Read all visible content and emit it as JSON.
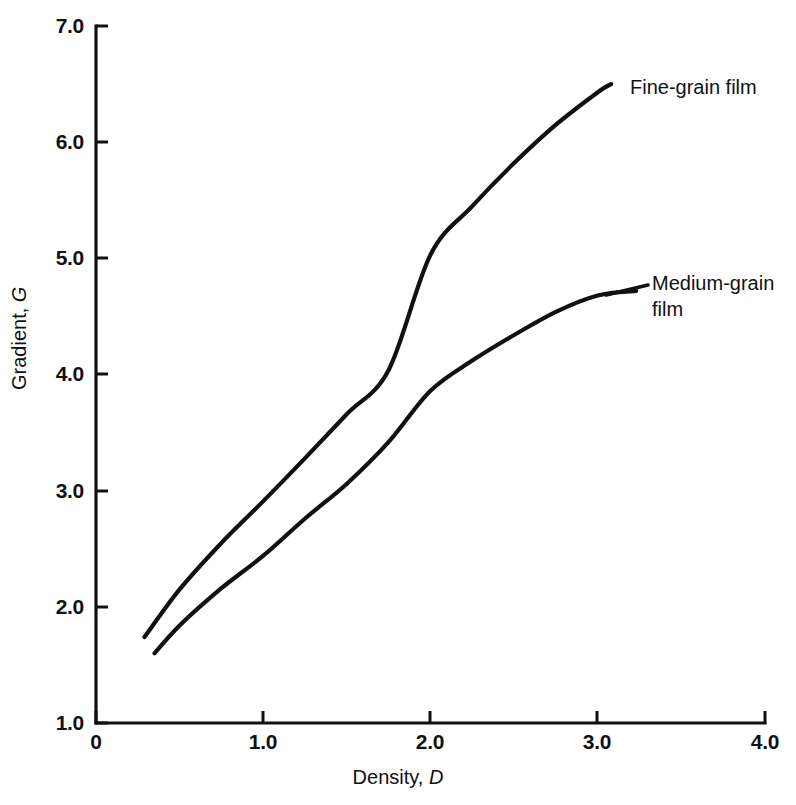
{
  "chart_data": {
    "type": "line",
    "title": "",
    "xlabel": "Density, D",
    "ylabel": "Gradient, G",
    "xlabel_plain": "Density,",
    "xlabel_symbol": "D",
    "ylabel_plain": "Gradient,",
    "ylabel_symbol": "G",
    "xlim": [
      0,
      4.0
    ],
    "ylim": [
      1.0,
      7.0
    ],
    "xticks": [
      0,
      1.0,
      2.0,
      3.0,
      4.0
    ],
    "xtick_labels": [
      "0",
      "1.0",
      "2.0",
      "3.0",
      "4.0"
    ],
    "yticks": [
      1.0,
      2.0,
      3.0,
      4.0,
      5.0,
      6.0,
      7.0
    ],
    "ytick_labels": [
      "1.0",
      "2.0",
      "3.0",
      "4.0",
      "5.0",
      "6.0",
      "7.0"
    ],
    "grid": false,
    "legend_position": "inline-annotation",
    "series": [
      {
        "name": "Fine-grain film",
        "label_lines": [
          "Fine-grain film"
        ],
        "color": "#111111",
        "x": [
          0.29,
          0.5,
          0.75,
          1.0,
          1.25,
          1.5,
          1.75,
          2.0,
          2.25,
          2.5,
          2.75,
          3.0,
          3.08
        ],
        "y": [
          1.74,
          2.15,
          2.55,
          2.91,
          3.28,
          3.66,
          4.04,
          5.03,
          5.45,
          5.82,
          6.15,
          6.43,
          6.5
        ]
      },
      {
        "name": "Medium-grain film",
        "label_lines": [
          "Medium-grain",
          "film"
        ],
        "color": "#111111",
        "x": [
          0.35,
          0.5,
          0.75,
          1.0,
          1.25,
          1.5,
          1.75,
          2.0,
          2.25,
          2.5,
          2.75,
          3.0,
          3.23
        ],
        "y": [
          1.6,
          1.84,
          2.16,
          2.44,
          2.76,
          3.06,
          3.42,
          3.86,
          4.12,
          4.34,
          4.54,
          4.68,
          4.72
        ]
      }
    ],
    "annotations": [
      {
        "text": "Fine-grain film",
        "at_x": 3.08,
        "at_y": 6.5
      },
      {
        "text": "Medium-grain film",
        "at_x": 3.23,
        "at_y": 4.72
      }
    ]
  },
  "axes": {
    "x_title_plain": "Density,",
    "x_title_symbol": "D",
    "y_title_plain": "Gradient,",
    "y_title_symbol": "G"
  },
  "labels": {
    "x": [
      "0",
      "1.0",
      "2.0",
      "3.0",
      "4.0"
    ],
    "y": [
      "7.0",
      "6.0",
      "5.0",
      "4.0",
      "3.0",
      "2.0",
      "1.0"
    ],
    "series_fine": "Fine-grain film",
    "series_medium_line1": "Medium-grain",
    "series_medium_line2": "film"
  }
}
